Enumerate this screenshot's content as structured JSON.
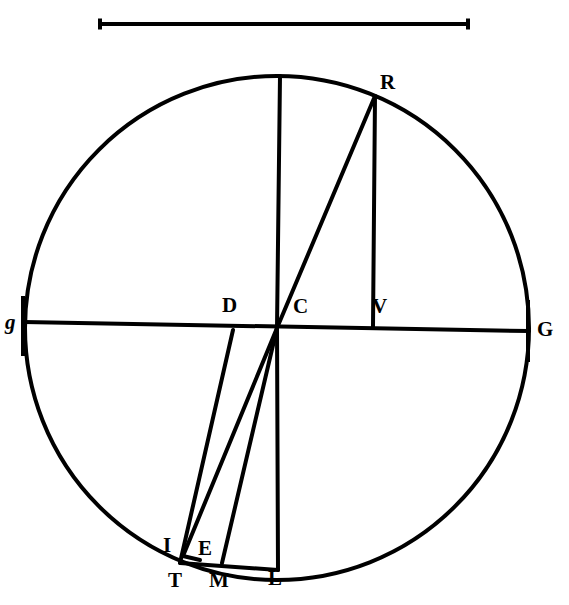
{
  "figure": {
    "background_color": "#ffffff",
    "ink_color": "#000000",
    "width": 569,
    "height": 605
  },
  "scale_bar": {
    "name": "scale-bar",
    "x1": 100,
    "x2": 468,
    "y": 24,
    "cap_height": 11,
    "thickness": 4
  },
  "circle": {
    "center_x": 277,
    "center_y": 328,
    "radius": 252,
    "stroke_width": 4
  },
  "labels": [
    {
      "id": "g-left",
      "text": "g",
      "x": 5,
      "y": 312,
      "style": "lbl-italic-lower"
    },
    {
      "id": "G-right",
      "text": "G",
      "x": 537,
      "y": 319,
      "style": "lbl-upper"
    },
    {
      "id": "R",
      "text": "R",
      "x": 380,
      "y": 72,
      "style": "lbl-upper"
    },
    {
      "id": "D",
      "text": "D",
      "x": 222,
      "y": 295,
      "style": "lbl-upper"
    },
    {
      "id": "C",
      "text": "C",
      "x": 293,
      "y": 296,
      "style": "lbl-upper"
    },
    {
      "id": "V",
      "text": "V",
      "x": 372,
      "y": 296,
      "style": "lbl-upper"
    },
    {
      "id": "I",
      "text": "I",
      "x": 163,
      "y": 535,
      "style": "lbl-upper"
    },
    {
      "id": "E",
      "text": "E",
      "x": 198,
      "y": 538,
      "style": "lbl-upper"
    },
    {
      "id": "T",
      "text": "T",
      "x": 168,
      "y": 570,
      "style": "lbl-upper"
    },
    {
      "id": "M",
      "text": "M",
      "x": 209,
      "y": 570,
      "style": "lbl-upper"
    },
    {
      "id": "L",
      "text": "L",
      "x": 268,
      "y": 568,
      "style": "lbl-upper"
    }
  ],
  "points": {
    "C": {
      "x": 277,
      "y": 328
    },
    "D": {
      "x": 233,
      "y": 330
    },
    "R": {
      "x": 375,
      "y": 96
    },
    "V": {
      "x": 373,
      "y": 327
    },
    "T": {
      "x": 180,
      "y": 563
    },
    "I": {
      "x": 183,
      "y": 556
    },
    "E": {
      "x": 200,
      "y": 560
    },
    "M": {
      "x": 222,
      "y": 563
    },
    "L": {
      "x": 278,
      "y": 570
    },
    "top": {
      "x": 280,
      "y": 76
    },
    "g": {
      "x": 24,
      "y": 322
    },
    "G": {
      "x": 529,
      "y": 331
    }
  },
  "segments": [
    {
      "name": "diameter-gG",
      "from": "g",
      "to": "G",
      "width": 4
    },
    {
      "name": "vertical-top-to-C",
      "from": "top",
      "to": "C",
      "width": 4
    },
    {
      "name": "chord-C-to-R",
      "from": "C",
      "to": "R",
      "width": 4
    },
    {
      "name": "perpendicular-R-V",
      "from": "R",
      "to": "V",
      "width": 4
    },
    {
      "name": "line-D-to-T",
      "from": "D",
      "to": "T",
      "width": 4
    },
    {
      "name": "chord-C-to-I",
      "from": "C",
      "to": "I",
      "width": 4
    },
    {
      "name": "chord-C-to-M",
      "from": "C",
      "to": "M",
      "width": 4
    },
    {
      "name": "vertical-C-to-L",
      "from": "C",
      "to": "L",
      "width": 4
    },
    {
      "name": "baseline-T-to-L",
      "from": "T",
      "to": "L",
      "width": 4
    },
    {
      "name": "base-I-to-E",
      "from": "I",
      "to": "E",
      "width": 4
    },
    {
      "name": "tick-left-g",
      "from": "gtop",
      "to": "gbot",
      "width": 4
    }
  ],
  "tick_marks": {
    "left_end_tick": {
      "x": 23,
      "y_top": 296,
      "y_bottom": 356
    },
    "right_end_tick": {
      "x": 528,
      "y_top": 300,
      "y_bottom": 362
    }
  }
}
